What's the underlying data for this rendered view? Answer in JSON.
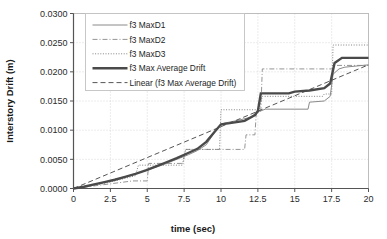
{
  "chart_data": {
    "type": "line",
    "title": "",
    "xlabel": "time (sec)",
    "ylabel": "Interstory Drift (m)",
    "xlim": [
      0,
      20
    ],
    "ylim": [
      0,
      0.03
    ],
    "xticks": [
      "0",
      "2.5",
      "5",
      "7.5",
      "10",
      "12.5",
      "15",
      "17.5",
      "20"
    ],
    "xtick_values": [
      0,
      2.5,
      5,
      7.5,
      10,
      12.5,
      15,
      17.5,
      20
    ],
    "yticks": [
      "0.0000",
      "0.0050",
      "0.0100",
      "0.0150",
      "0.0200",
      "0.0250",
      "0.0300"
    ],
    "ytick_values": [
      0,
      0.005,
      0.01,
      0.015,
      0.02,
      0.025,
      0.03
    ],
    "grid": true,
    "grid_style": "dotted",
    "legend_position": "upper-left-inside",
    "series": [
      {
        "name": "f3 MaxD1",
        "style": "solid-thin",
        "color": "#8a8a8a",
        "points": [
          [
            0,
            0.0
          ],
          [
            0.6,
            0.0002
          ],
          [
            1.2,
            0.0005
          ],
          [
            1.8,
            0.0009
          ],
          [
            2.4,
            0.0013
          ],
          [
            3.0,
            0.0017
          ],
          [
            3.6,
            0.0021
          ],
          [
            4.2,
            0.0025
          ],
          [
            4.8,
            0.003
          ],
          [
            5.4,
            0.0035
          ],
          [
            6.0,
            0.004
          ],
          [
            6.6,
            0.0046
          ],
          [
            7.2,
            0.0052
          ],
          [
            7.8,
            0.0058
          ],
          [
            8.4,
            0.0065
          ],
          [
            9.0,
            0.0075
          ],
          [
            9.4,
            0.009
          ],
          [
            9.8,
            0.0105
          ],
          [
            10.2,
            0.0112
          ],
          [
            11.0,
            0.0116
          ],
          [
            12.0,
            0.0122
          ],
          [
            12.6,
            0.0132
          ],
          [
            13.0,
            0.0136
          ],
          [
            14.0,
            0.0136
          ],
          [
            15.0,
            0.0136
          ],
          [
            15.9,
            0.0136
          ],
          [
            16.0,
            0.0148
          ],
          [
            17.0,
            0.015
          ],
          [
            17.4,
            0.0158
          ],
          [
            17.6,
            0.0196
          ],
          [
            18.0,
            0.0205
          ],
          [
            18.4,
            0.0208
          ],
          [
            20,
            0.0212
          ]
        ]
      },
      {
        "name": "f3 MaxD2",
        "style": "dash-dot",
        "color": "#8f8f8f",
        "points": [
          [
            0,
            0.0
          ],
          [
            2.5,
            0.0008
          ],
          [
            4.0,
            0.0013
          ],
          [
            5.0,
            0.0013
          ],
          [
            5.1,
            0.0043
          ],
          [
            7.4,
            0.0043
          ],
          [
            7.6,
            0.0067
          ],
          [
            11.6,
            0.0067
          ],
          [
            11.7,
            0.0092
          ],
          [
            12.3,
            0.0092
          ],
          [
            12.4,
            0.0133
          ],
          [
            12.7,
            0.0133
          ],
          [
            12.8,
            0.0205
          ],
          [
            17.6,
            0.0205
          ],
          [
            17.7,
            0.0211
          ],
          [
            20,
            0.0211
          ]
        ]
      },
      {
        "name": "f3 MaxD3",
        "style": "dotted",
        "color": "#7d7d7d",
        "points": [
          [
            0,
            0.0
          ],
          [
            2.0,
            0.0008
          ],
          [
            3.6,
            0.0018
          ],
          [
            4.2,
            0.0022
          ],
          [
            4.4,
            0.004
          ],
          [
            7.4,
            0.004
          ],
          [
            7.6,
            0.0067
          ],
          [
            9.9,
            0.0067
          ],
          [
            10.0,
            0.0135
          ],
          [
            12.6,
            0.0135
          ],
          [
            12.8,
            0.0158
          ],
          [
            16.9,
            0.0158
          ],
          [
            17.0,
            0.0162
          ],
          [
            17.5,
            0.0162
          ],
          [
            17.6,
            0.0246
          ],
          [
            20,
            0.0246
          ]
        ]
      },
      {
        "name": "f3 Max Average Drift",
        "style": "solid-thick",
        "color": "#4a4a4a",
        "points": [
          [
            0,
            0.0
          ],
          [
            0.7,
            0.0003
          ],
          [
            1.4,
            0.0007
          ],
          [
            2.1,
            0.0011
          ],
          [
            2.8,
            0.0015
          ],
          [
            3.5,
            0.002
          ],
          [
            4.2,
            0.0025
          ],
          [
            4.9,
            0.0031
          ],
          [
            5.6,
            0.0038
          ],
          [
            6.3,
            0.0045
          ],
          [
            7.0,
            0.0052
          ],
          [
            7.7,
            0.006
          ],
          [
            8.4,
            0.0068
          ],
          [
            9.0,
            0.008
          ],
          [
            9.5,
            0.0095
          ],
          [
            10.0,
            0.011
          ],
          [
            10.6,
            0.0112
          ],
          [
            11.6,
            0.0116
          ],
          [
            12.3,
            0.0126
          ],
          [
            12.5,
            0.0133
          ],
          [
            12.7,
            0.0163
          ],
          [
            14.6,
            0.0163
          ],
          [
            15.0,
            0.0166
          ],
          [
            16.0,
            0.0168
          ],
          [
            17.0,
            0.0172
          ],
          [
            17.4,
            0.018
          ],
          [
            17.7,
            0.0215
          ],
          [
            18.2,
            0.0224
          ],
          [
            20,
            0.0224
          ]
        ]
      },
      {
        "name": "Linear (f3 Max Average Drift)",
        "style": "dashed",
        "color": "#555555",
        "points": [
          [
            0,
            0.0
          ],
          [
            20,
            0.0212
          ]
        ]
      }
    ]
  },
  "legend": {
    "entries": [
      {
        "label": "f3 MaxD1",
        "style": "solid-thin"
      },
      {
        "label": "f3 MaxD2",
        "style": "dash-dot"
      },
      {
        "label": "f3 MaxD3",
        "style": "dotted"
      },
      {
        "label": "f3 Max Average Drift",
        "style": "solid-thick"
      },
      {
        "label": "Linear (f3 Max Average Drift)",
        "style": "dashed"
      }
    ]
  },
  "colors": {
    "axis": "#555555",
    "grid": "#cfcfcf",
    "text": "#1a1a1a",
    "background": "#ffffff"
  }
}
